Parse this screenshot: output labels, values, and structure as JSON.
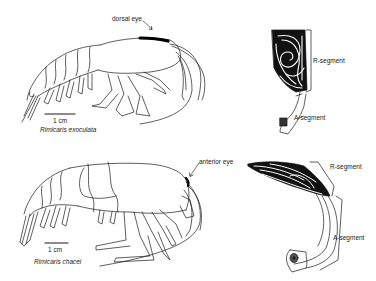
{
  "figure": {
    "panels": [
      {
        "species": "Rimicaris exoculata",
        "eye_label": "dorsal eye",
        "scale_bar": "1 cm",
        "eye_detail": {
          "upper_label": "R-segment",
          "lower_label": "A-segment"
        }
      },
      {
        "species": "Rimicaris chacei",
        "eye_label": "anterior eye",
        "scale_bar": "1 cm",
        "eye_detail": {
          "upper_label": "R-segment",
          "lower_label": "A-segment"
        }
      }
    ]
  },
  "colors": {
    "background": "#ffffff",
    "ink": "#111111"
  }
}
